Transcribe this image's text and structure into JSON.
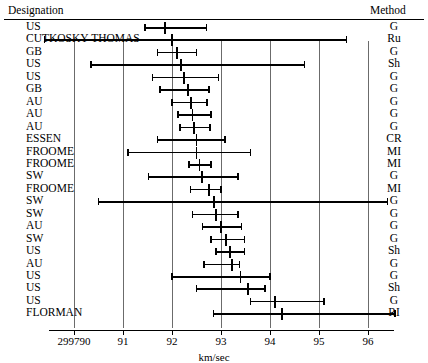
{
  "header": {
    "designation_label": "Designation",
    "method_label": "Method"
  },
  "axis": {
    "xlabel": "km/sec",
    "tick_labels": [
      "299790",
      "91",
      "92",
      "93",
      "94",
      "95",
      "96"
    ],
    "tick_values": [
      299790,
      299791,
      299792,
      299793,
      299794,
      299795,
      299796
    ]
  },
  "chart_data": {
    "type": "scatter",
    "plot_style": "forest-plot-error-bars",
    "title": "",
    "xlabel": "km/sec",
    "ylabel": "Designation",
    "xlim": [
      299789.5,
      299796.6
    ],
    "grid": "vertical-gridlines-at-each-tick",
    "legend": "none",
    "x_tick_labels": [
      "299790",
      "91",
      "92",
      "93",
      "94",
      "95",
      "96"
    ],
    "columns": [
      "Designation",
      "Estimate (km/sec)",
      "CI low",
      "CI high",
      "Method"
    ],
    "rows": [
      {
        "designation": "US",
        "method": "G",
        "value": 299791.85,
        "low": 299791.45,
        "high": 299792.7
      },
      {
        "designation": "CUTKOSKY-THOMAS",
        "method": "Ru",
        "value": 299792.0,
        "low": 299789.4,
        "high": 299795.56
      },
      {
        "designation": "GB",
        "method": "G",
        "value": 299792.1,
        "low": 299791.7,
        "high": 299792.5
      },
      {
        "designation": "US",
        "method": "Sh",
        "value": 299792.18,
        "low": 299790.35,
        "high": 299794.7
      },
      {
        "designation": "US",
        "method": "G",
        "value": 299792.25,
        "low": 299791.6,
        "high": 299792.95
      },
      {
        "designation": "GB",
        "method": "G",
        "value": 299792.32,
        "low": 299791.75,
        "high": 299792.75
      },
      {
        "designation": "AU",
        "method": "G",
        "value": 299792.38,
        "low": 299792.0,
        "high": 299792.72
      },
      {
        "designation": "AU",
        "method": "G",
        "value": 299792.42,
        "low": 299792.12,
        "high": 299792.8
      },
      {
        "designation": "AU",
        "method": "G",
        "value": 299792.45,
        "low": 299792.16,
        "high": 299792.78
      },
      {
        "designation": "ESSEN",
        "method": "CR",
        "value": 299792.5,
        "low": 299791.7,
        "high": 299793.08
      },
      {
        "designation": "FROOME",
        "method": "MI",
        "value": 299792.5,
        "low": 299791.1,
        "high": 299793.6
      },
      {
        "designation": "FROOME",
        "method": "MI",
        "value": 299792.56,
        "low": 299792.35,
        "high": 299792.8
      },
      {
        "designation": "SW",
        "method": "G",
        "value": 299792.62,
        "low": 299791.52,
        "high": 299793.35
      },
      {
        "designation": "FROOME",
        "method": "MI",
        "value": 299792.75,
        "low": 299792.38,
        "high": 299793.0
      },
      {
        "designation": "SW",
        "method": "G",
        "value": 299792.85,
        "low": 299790.5,
        "high": 299796.4
      },
      {
        "designation": "SW",
        "method": "G",
        "value": 299792.9,
        "low": 299792.42,
        "high": 299793.35
      },
      {
        "designation": "AU",
        "method": "G",
        "value": 299793.0,
        "low": 299792.62,
        "high": 299793.42
      },
      {
        "designation": "SW",
        "method": "G",
        "value": 299793.1,
        "low": 299792.8,
        "high": 299793.48
      },
      {
        "designation": "US",
        "method": "Sh",
        "value": 299793.18,
        "low": 299792.9,
        "high": 299793.48
      },
      {
        "designation": "AU",
        "method": "G",
        "value": 299793.22,
        "low": 299792.65,
        "high": 299793.38
      },
      {
        "designation": "US",
        "method": "G",
        "value": 299793.4,
        "low": 299792.0,
        "high": 299794.0
      },
      {
        "designation": "US",
        "method": "Sh",
        "value": 299793.55,
        "low": 299792.5,
        "high": 299793.9
      },
      {
        "designation": "US",
        "method": "G",
        "value": 299794.1,
        "low": 299793.6,
        "high": 299795.1
      },
      {
        "designation": "FLORMAN",
        "method": "RI",
        "value": 299794.25,
        "low": 299792.85,
        "high": 299796.55
      }
    ]
  }
}
